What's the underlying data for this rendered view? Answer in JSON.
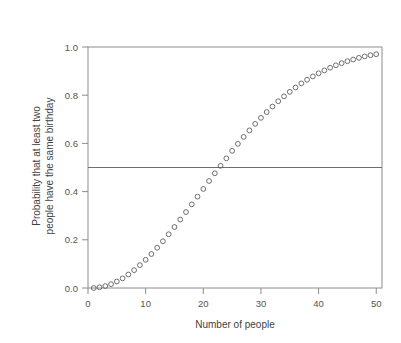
{
  "chart_data": {
    "type": "scatter",
    "title": "",
    "xlabel": "Number of people",
    "ylabel_line1": "Probability that at least two",
    "ylabel_line2": "people have the same birthday",
    "xlim": [
      0,
      51
    ],
    "ylim": [
      0.0,
      1.0
    ],
    "grid": false,
    "legend": "none",
    "marker_style": "open-circle",
    "marker_color": "#5f5f5f",
    "frame_color": "#8c8c8c",
    "background_color": "#ffffff",
    "xticks": [
      0,
      10,
      20,
      30,
      40,
      50
    ],
    "xtick_labels": [
      "0",
      "10",
      "20",
      "30",
      "40",
      "50"
    ],
    "yticks": [
      0.0,
      0.2,
      0.4,
      0.6,
      0.8,
      1.0
    ],
    "ytick_labels": [
      "0.0",
      "0.2",
      "0.4",
      "0.6",
      "0.8",
      "1.0"
    ],
    "annotations": [
      {
        "type": "hline",
        "y": 0.5,
        "label": "",
        "color": "#6e6e6e"
      }
    ],
    "x": [
      1,
      2,
      3,
      4,
      5,
      6,
      7,
      8,
      9,
      10,
      11,
      12,
      13,
      14,
      15,
      16,
      17,
      18,
      19,
      20,
      21,
      22,
      23,
      24,
      25,
      26,
      27,
      28,
      29,
      30,
      31,
      32,
      33,
      34,
      35,
      36,
      37,
      38,
      39,
      40,
      41,
      42,
      43,
      44,
      45,
      46,
      47,
      48,
      49,
      50
    ],
    "y": [
      0.0,
      0.003,
      0.008,
      0.016,
      0.027,
      0.04,
      0.056,
      0.074,
      0.095,
      0.117,
      0.141,
      0.167,
      0.194,
      0.223,
      0.253,
      0.284,
      0.315,
      0.347,
      0.379,
      0.411,
      0.444,
      0.476,
      0.507,
      0.538,
      0.569,
      0.598,
      0.627,
      0.654,
      0.681,
      0.706,
      0.73,
      0.753,
      0.775,
      0.795,
      0.814,
      0.832,
      0.849,
      0.864,
      0.878,
      0.891,
      0.903,
      0.914,
      0.924,
      0.933,
      0.941,
      0.948,
      0.955,
      0.961,
      0.966,
      0.97
    ]
  }
}
